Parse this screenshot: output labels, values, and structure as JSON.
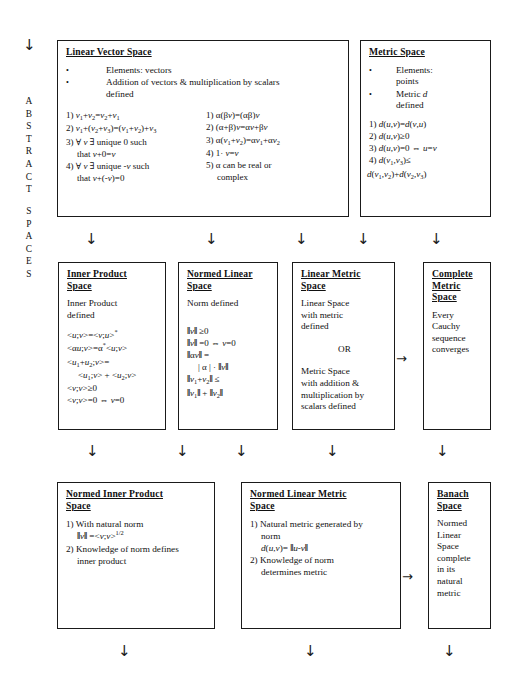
{
  "diagram": {
    "side_label": "ABSTRACT SPACES",
    "side_label_line1": "ABSTRACT",
    "side_label_line2": "SPACES",
    "arrow_down_glyph": "↓",
    "arrow_right_glyph": "→"
  },
  "boxes": {
    "linear_vector_space": {
      "title": "Linear Vector Space",
      "bullets": [
        "Elements: vectors",
        "Addition of vectors & multiplication by scalars defined"
      ],
      "axioms_left": [
        "1) v1+v2=v2+v1",
        "2) v1+(v2+v3)=(v1+v2)+v3",
        "3) ∀ v ∃ unique 0 such that v+0=v",
        "4) ∀ v ∃ unique -v such that v+(-v)=0"
      ],
      "axioms_right": [
        "1) α(βv)=(αβ)v",
        "2) (α+β)v=αv+βv",
        "3) α(v1+v2)=αv1+αv2",
        "4) 1 · v=v",
        "5) α can be real or complex"
      ]
    },
    "metric_space": {
      "title": "Metric Space",
      "bullets": [
        "Elements: points",
        "Metric d defined"
      ],
      "axioms": [
        "1) d(u,v)=d(v,u)",
        "2) d(u,v)≥0",
        "3) d(u,v)=0 ⇔ u=v",
        "4) d(v1,v3)≤ d(v1,v2)+d(v2,v3)"
      ]
    },
    "inner_product_space": {
      "title": "Inner Product Space",
      "subtitle": "Inner Product defined",
      "axioms": [
        "<u;v>=<v;u>*",
        "<αu;v>=α*<u;v>",
        "<u1+u2;v>= <u1;v> + <u2;v>",
        "<v;v>≥0",
        "<v;v>=0 ⇔ v=0"
      ]
    },
    "normed_linear_space": {
      "title": "Normed Linear Space",
      "subtitle": "Norm defined",
      "axioms": [
        "‖v‖ ≥0",
        "‖v‖ =0 ⇔ v=0",
        "‖αv‖ = |α| · ‖v‖",
        "‖v1+v2‖ ≤ ‖v1‖ + ‖v2‖"
      ]
    },
    "linear_metric_space": {
      "title": "Linear Metric Space",
      "line1": "Linear Space with metric defined",
      "or": "OR",
      "line2": "Metric Space with addition & multiplication by scalars defined"
    },
    "complete_metric_space": {
      "title": "Complete Metric Space",
      "body": "Every Cauchy sequence converges"
    },
    "normed_inner_product_space": {
      "title": "Normed Inner Product Space",
      "items": [
        "1) With natural norm ‖v‖ =<v;v>1/2",
        "2) Knowledge of norm defines inner product"
      ]
    },
    "normed_linear_metric_space": {
      "title": "Normed Linear Metric Space",
      "items": [
        "1) Natural metric generated by norm d(u,v)= ‖u-v‖",
        "2) Knowledge of norm determines metric"
      ]
    },
    "banach_space": {
      "title": "Banach Space",
      "body": "Normed Linear Space complete in its natural metric"
    }
  },
  "colors": {
    "ink": "#111111",
    "border": "#1a1a1a",
    "bg": "#ffffff"
  }
}
